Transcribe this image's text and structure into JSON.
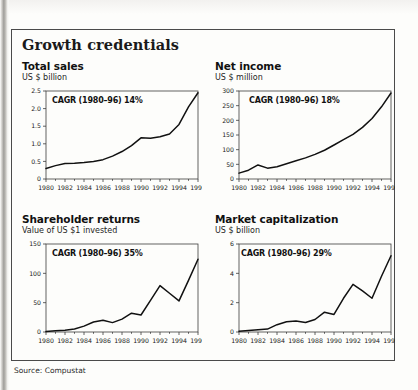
{
  "figure": {
    "title": "Growth credentials",
    "source": "Source: Compustat"
  },
  "panels": [
    {
      "id": "total-sales",
      "title": "Total sales",
      "subtitle": "US $ billion",
      "cagr_label": "CAGR (1980–96) 14%"
    },
    {
      "id": "net-income",
      "title": "Net income",
      "subtitle": "US $ million",
      "cagr_label": "CAGR (1980–96) 18%"
    },
    {
      "id": "shareholder-returns",
      "title": "Shareholder returns",
      "subtitle": "Value of US $1 invested",
      "cagr_label": "CAGR (1980–96) 35%"
    },
    {
      "id": "market-capitalization",
      "title": "Market capitalization",
      "subtitle": "US $ billion",
      "cagr_label": "CAGR (1980–96) 29%"
    }
  ],
  "chart_data": [
    {
      "type": "line",
      "title": "Total sales",
      "subtitle": "US $ billion",
      "xlabel": "",
      "ylabel": "US $ billion",
      "annotation": "CAGR (1980–96) 14%",
      "grid": false,
      "legend": "none",
      "xlim": [
        1980,
        1996
      ],
      "ylim": [
        0,
        2.5
      ],
      "yticks": [
        0,
        0.5,
        1.0,
        1.5,
        2.0,
        2.5
      ],
      "ytick_labels": [
        "0",
        "0.5",
        "1.0",
        "1.5",
        "2.0",
        "2.5"
      ],
      "xticks": [
        1980,
        1982,
        1984,
        1986,
        1988,
        1990,
        1992,
        1994,
        1996
      ],
      "xtick_labels": [
        "1980",
        "1982",
        "1984",
        "1986",
        "1988",
        "1990",
        "1992",
        "1994",
        "1996"
      ],
      "x": [
        1980,
        1981,
        1982,
        1983,
        1984,
        1985,
        1986,
        1987,
        1988,
        1989,
        1990,
        1991,
        1992,
        1993,
        1994,
        1995,
        1996
      ],
      "values": [
        0.3,
        0.38,
        0.44,
        0.45,
        0.47,
        0.5,
        0.55,
        0.65,
        0.78,
        0.95,
        1.17,
        1.16,
        1.2,
        1.28,
        1.55,
        2.05,
        2.45
      ]
    },
    {
      "type": "line",
      "title": "Net income",
      "subtitle": "US $ million",
      "xlabel": "",
      "ylabel": "US $ million",
      "annotation": "CAGR (1980–96) 18%",
      "grid": false,
      "legend": "none",
      "xlim": [
        1980,
        1996
      ],
      "ylim": [
        0,
        300
      ],
      "yticks": [
        0,
        50,
        100,
        150,
        200,
        250,
        300
      ],
      "ytick_labels": [
        "0",
        "50",
        "100",
        "150",
        "200",
        "250",
        "300"
      ],
      "xticks": [
        1980,
        1982,
        1984,
        1986,
        1988,
        1990,
        1992,
        1994,
        1996
      ],
      "xtick_labels": [
        "1980",
        "1982",
        "1984",
        "1986",
        "1988",
        "1990",
        "1992",
        "1994",
        "1996"
      ],
      "x": [
        1980,
        1981,
        1982,
        1983,
        1984,
        1985,
        1986,
        1987,
        1988,
        1989,
        1990,
        1991,
        1992,
        1993,
        1994,
        1995,
        1996
      ],
      "values": [
        20,
        30,
        48,
        37,
        42,
        52,
        62,
        72,
        84,
        98,
        116,
        134,
        152,
        176,
        206,
        246,
        293
      ]
    },
    {
      "type": "line",
      "title": "Shareholder returns",
      "subtitle": "Value of US $1 invested",
      "xlabel": "",
      "ylabel": "Value of US $1 invested",
      "annotation": "CAGR (1980–96) 35%",
      "grid": false,
      "legend": "none",
      "xlim": [
        1980,
        1996
      ],
      "ylim": [
        0,
        150
      ],
      "yticks": [
        0,
        50,
        100,
        150
      ],
      "ytick_labels": [
        "0",
        "50",
        "100",
        "150"
      ],
      "xticks": [
        1980,
        1982,
        1984,
        1986,
        1988,
        1990,
        1992,
        1994,
        1996
      ],
      "xtick_labels": [
        "1980",
        "1982",
        "1984",
        "1986",
        "1988",
        "1990",
        "1992",
        "1994",
        "1996"
      ],
      "x": [
        1980,
        1981,
        1982,
        1983,
        1984,
        1985,
        1986,
        1987,
        1988,
        1989,
        1990,
        1991,
        1992,
        1993,
        1994,
        1995,
        1996
      ],
      "values": [
        1,
        2,
        3,
        5,
        10,
        17,
        20,
        16,
        22,
        32,
        29,
        54,
        79,
        66,
        53,
        88,
        124
      ]
    },
    {
      "type": "line",
      "title": "Market capitalization",
      "subtitle": "US $ billion",
      "xlabel": "",
      "ylabel": "US $ billion",
      "annotation": "CAGR (1980–96) 29%",
      "grid": false,
      "legend": "none",
      "xlim": [
        1980,
        1996
      ],
      "ylim": [
        0,
        6
      ],
      "yticks": [
        0,
        2,
        4,
        6
      ],
      "ytick_labels": [
        "0",
        "2",
        "4",
        "6"
      ],
      "xticks": [
        1980,
        1982,
        1984,
        1986,
        1988,
        1990,
        1992,
        1994,
        1996
      ],
      "xtick_labels": [
        "1980",
        "1982",
        "1984",
        "1986",
        "1988",
        "1990",
        "1992",
        "1994",
        "1996"
      ],
      "x": [
        1980,
        1981,
        1982,
        1983,
        1984,
        1985,
        1986,
        1987,
        1988,
        1989,
        1990,
        1991,
        1992,
        1993,
        1994,
        1995,
        1996
      ],
      "values": [
        0.05,
        0.1,
        0.15,
        0.2,
        0.5,
        0.7,
        0.75,
        0.65,
        0.85,
        1.35,
        1.2,
        2.3,
        3.25,
        2.8,
        2.3,
        3.8,
        5.2
      ]
    }
  ],
  "colors": {
    "line": "#111111",
    "axis": "#3c3c3c",
    "frame": "#4a4a4a",
    "text": "#111111"
  }
}
